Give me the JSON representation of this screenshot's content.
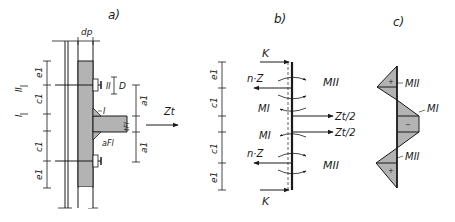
{
  "panels": {
    "a": {
      "title": "a)",
      "dim_top": "dp",
      "dims_left": [
        "e1",
        "c1",
        "c1",
        "e1"
      ],
      "section_marks": [
        "II",
        "I"
      ],
      "bolt_label": "II",
      "bolt_dim": "D",
      "flange_label": "I",
      "flange_thickness": "tFl",
      "weld_label": "aFl",
      "dims_right": [
        "a1",
        "a1"
      ],
      "force": "Zt"
    },
    "b": {
      "title": "b)",
      "dims_left": [
        "e1",
        "c1",
        "c1",
        "e1"
      ],
      "forces_left": [
        "K",
        "n·Z",
        "MI",
        "MI",
        "n·Z",
        "K"
      ],
      "moments_right": [
        "MII",
        "MII"
      ],
      "forces_right": [
        "Zt/2",
        "Zt/2"
      ]
    },
    "c": {
      "title": "c)",
      "moment_labels": [
        "MII",
        "MI",
        "MII"
      ],
      "signs": [
        "+",
        "−",
        "+"
      ]
    }
  },
  "colors": {
    "line": "#1a1a1a",
    "fill": "#b3b3b3",
    "background": "#ffffff"
  }
}
